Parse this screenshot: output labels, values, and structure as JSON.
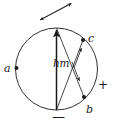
{
  "figure": {
    "kind": "geometric-diagram",
    "width": 113,
    "height": 126,
    "background_color": "#ffffff",
    "stroke_color": "#1a1a1a",
    "circle": {
      "center_x": 56.5,
      "center_y": 69,
      "radius": 41
    },
    "labels": {
      "point_a": "a",
      "point_b": "b",
      "point_c": "c",
      "vector_hm": "hm",
      "polarity_positive": "+",
      "polarity_negative": "—"
    },
    "points": [
      {
        "name": "a",
        "x": 16,
        "y": 68
      },
      {
        "name": "b",
        "x": 84,
        "y": 97
      },
      {
        "name": "c",
        "x": 83,
        "y": 40
      }
    ],
    "arrows": {
      "main_vertical": {
        "from_x": 56.5,
        "from_y": 110,
        "to_x": 56.5,
        "to_y": 28
      },
      "chord_top_to_b": {
        "from_x": 56.5,
        "from_y": 28,
        "to_x": 84,
        "to_y": 97
      },
      "chord_c_to_bottom": {
        "from_x": 83,
        "from_y": 40,
        "to_x": 56.5,
        "to_y": 110
      },
      "cross_upper_right": {
        "from_x": 41,
        "from_y": 19,
        "to_x": 72,
        "to_y": 3
      },
      "cross_lower_left": {
        "from_x": 70,
        "from_y": 3,
        "to_x": 40,
        "to_y": 20
      }
    }
  }
}
